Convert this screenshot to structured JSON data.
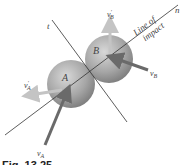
{
  "figure": {
    "caption": "Fig. 13.25",
    "axes": {
      "t_label": "t",
      "n_label": "n"
    },
    "line_of_impact": {
      "line1": "Line of",
      "line2": "impact"
    },
    "spheres": [
      {
        "label": "A",
        "cx": 71,
        "cy": 84,
        "r": 24
      },
      {
        "label": "B",
        "cx": 109,
        "cy": 59,
        "r": 24
      }
    ],
    "vectors": {
      "vA": {
        "label": "v",
        "sub": "A",
        "prime": ""
      },
      "vA_prime": {
        "label": "v",
        "sub": "A",
        "prime": "′"
      },
      "vB": {
        "label": "v",
        "sub": "B",
        "prime": ""
      },
      "vB_prime": {
        "label": "v",
        "sub": "B",
        "prime": "′"
      }
    },
    "colors": {
      "sphere_light": "#d2d2d2",
      "sphere_dark": "#7c7c7c",
      "arrow_before": "#6a6a6a",
      "arrow_after": "#c4c4c4",
      "line": "#333333"
    }
  }
}
